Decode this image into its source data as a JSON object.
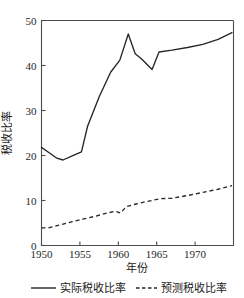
{
  "chart_data": {
    "type": "line",
    "title": "",
    "xlabel": "年份",
    "ylabel": "税收比率",
    "xlim": [
      1950,
      1975
    ],
    "ylim": [
      0,
      50
    ],
    "grid": false,
    "legend_position": "bottom",
    "xticks": [
      1950,
      1955,
      1960,
      1965,
      1970
    ],
    "xtick_labels": [
      "1950",
      "1955",
      "1960",
      "1965",
      "1970"
    ],
    "yticks": [
      0,
      10,
      20,
      30,
      40,
      50
    ],
    "ytick_labels": [
      "0",
      "10",
      "20",
      "30",
      "40",
      "50"
    ],
    "series": [
      {
        "name": "实际税收比率",
        "style": "solid",
        "color": "#262626",
        "x": [
          1950,
          1951,
          1952,
          1952.8,
          1954,
          1955.2,
          1956,
          1957.5,
          1959,
          1960.2,
          1961.3,
          1962.2,
          1963,
          1964.4,
          1965.3,
          1967,
          1969,
          1971,
          1973,
          1974.8
        ],
        "values": [
          21.8,
          20.6,
          19.4,
          19.0,
          19.9,
          20.8,
          26.5,
          33.0,
          38.5,
          41.2,
          47.0,
          42.6,
          41.5,
          39.1,
          43.0,
          43.4,
          44.0,
          44.7,
          45.8,
          47.3
        ]
      },
      {
        "name": "预测税收比率",
        "style": "dashed",
        "color": "#262626",
        "x": [
          1950,
          1951,
          1952.5,
          1954,
          1955.5,
          1957,
          1958.5,
          1959.6,
          1960.3,
          1961,
          1962,
          1963.2,
          1964.4,
          1965.4,
          1967,
          1969,
          1971,
          1973,
          1974.8
        ],
        "values": [
          3.9,
          3.95,
          4.6,
          5.3,
          5.9,
          6.5,
          7.2,
          7.6,
          7.2,
          8.6,
          9.1,
          9.6,
          10.0,
          10.4,
          10.5,
          11.1,
          11.8,
          12.5,
          13.3
        ]
      }
    ]
  },
  "legend": {
    "items": [
      {
        "label": "实际税收比率",
        "style": "solid"
      },
      {
        "label": "预测税收比率",
        "style": "dashed"
      }
    ]
  }
}
